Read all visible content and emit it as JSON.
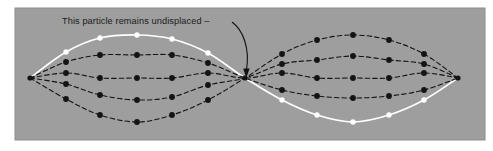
{
  "figure": {
    "panel": {
      "background_color": "#9e9e9e",
      "border_color": "#8a8a8a",
      "x": 15,
      "y": 8,
      "width": 470,
      "height": 132
    },
    "annotation": {
      "text": "This particle remains undisplaced",
      "dash_suffix": "–",
      "text_x": 62,
      "text_y": 24,
      "color": "#1a1a1a",
      "pointer_target_label": "center-node"
    },
    "nodes": [
      {
        "name": "left-node",
        "x": 30,
        "y": 78
      },
      {
        "name": "center-node",
        "x": 245,
        "y": 78
      },
      {
        "name": "right-node",
        "x": 458,
        "y": 78
      }
    ],
    "colors": {
      "white_curve": "#ffffff",
      "black_curve": "#141414",
      "dot_black": "#141414",
      "dot_white": "#ffffff"
    },
    "curve_labels": [
      "maximum-displacement-white",
      "intermediate-upper-black",
      "equilibrium-black",
      "intermediate-lower-black",
      "maximum-opposite-black"
    ]
  },
  "chart_data": {
    "type": "line",
    "title": "This particle remains undisplaced",
    "xlabel": "",
    "ylabel": "",
    "xlim": [
      30,
      458
    ],
    "ylim": [
      22,
      134
    ],
    "grid": false,
    "legend": "none",
    "annotations": [
      {
        "text": "This particle remains undisplaced",
        "points_to": {
          "x": 245,
          "y": 78
        },
        "anchor": {
          "x": 62,
          "y": 24
        }
      }
    ],
    "x_sample_columns_left": [
      30,
      66,
      100,
      137,
      172,
      208,
      245
    ],
    "x_sample_columns_right": [
      245,
      282,
      317,
      353,
      389,
      424,
      458
    ],
    "series": [
      {
        "name": "maximum-displacement-white",
        "style": "white-solid",
        "dot_color": "#ffffff",
        "amplitude": 43,
        "x": [
          30,
          66,
          100,
          137,
          172,
          208,
          245,
          282,
          317,
          353,
          389,
          424,
          458
        ],
        "y": [
          78,
          52,
          38,
          35,
          39,
          53,
          78,
          100,
          115,
          122,
          115,
          100,
          78
        ]
      },
      {
        "name": "intermediate-upper-black",
        "style": "black-dashed",
        "dot_color": "#141414",
        "amplitude": 23,
        "x": [
          30,
          66,
          100,
          137,
          172,
          208,
          245,
          282,
          317,
          353,
          389,
          424,
          458
        ],
        "y": [
          78,
          62,
          55,
          55,
          55,
          63,
          78,
          90,
          96,
          98,
          96,
          90,
          78
        ]
      },
      {
        "name": "equilibrium-black",
        "style": "black-dashed",
        "dot_color": "#141414",
        "amplitude": 0,
        "x": [
          30,
          66,
          100,
          137,
          172,
          208,
          245,
          282,
          317,
          353,
          389,
          424,
          458
        ],
        "y": [
          78,
          73,
          78,
          78,
          78,
          73,
          78,
          73,
          78,
          78,
          78,
          73,
          78
        ]
      },
      {
        "name": "intermediate-lower-black",
        "style": "black-dashed",
        "dot_color": "#141414",
        "amplitude": -23,
        "x": [
          30,
          66,
          100,
          137,
          172,
          208,
          245,
          282,
          317,
          353,
          389,
          424,
          458
        ],
        "y": [
          78,
          84,
          95,
          100,
          97,
          85,
          78,
          64,
          60,
          56,
          60,
          64,
          78
        ]
      },
      {
        "name": "maximum-opposite-black",
        "style": "black-dashed",
        "dot_color": "#141414",
        "amplitude": -44,
        "x": [
          30,
          66,
          100,
          137,
          172,
          208,
          245,
          282,
          317,
          353,
          389,
          424,
          458
        ],
        "y": [
          78,
          99,
          115,
          122,
          115,
          100,
          78,
          54,
          40,
          35,
          40,
          54,
          78
        ]
      }
    ]
  }
}
